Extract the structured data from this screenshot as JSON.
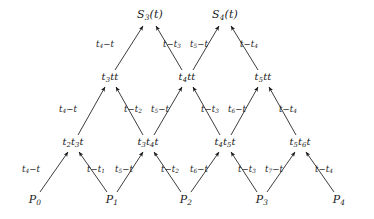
{
  "diagram": {
    "width": 374,
    "height": 219,
    "background": "#ffffff",
    "ink": "#1a1a1a",
    "levels": [
      {
        "name": "control-points",
        "row": 0,
        "y": 200,
        "nodes": [
          {
            "id": "P0",
            "label": "P0",
            "base": "P",
            "sub": "0",
            "x": 35
          },
          {
            "id": "P1",
            "label": "P1",
            "base": "P",
            "sub": "1",
            "x": 112
          },
          {
            "id": "P2",
            "label": "P2",
            "base": "P",
            "sub": "2",
            "x": 186
          },
          {
            "id": "P3",
            "label": "P3",
            "base": "P",
            "sub": "3",
            "x": 262
          },
          {
            "id": "P4",
            "label": "P4",
            "base": "P",
            "sub": "4",
            "x": 339
          }
        ]
      },
      {
        "name": "level-1",
        "row": 1,
        "y": 143,
        "nodes": [
          {
            "id": "L1A",
            "label": "t2t3t",
            "x": 73
          },
          {
            "id": "L1B",
            "label": "t3t4t",
            "x": 148
          },
          {
            "id": "L1C",
            "label": "t4t5t",
            "x": 225
          },
          {
            "id": "L1D",
            "label": "t5t6t",
            "x": 300
          }
        ]
      },
      {
        "name": "level-2",
        "row": 2,
        "y": 78,
        "nodes": [
          {
            "id": "L2A",
            "label": "t3tt",
            "x": 110
          },
          {
            "id": "L2B",
            "label": "t4tt",
            "x": 187
          },
          {
            "id": "L2C",
            "label": "t5tt",
            "x": 263
          }
        ]
      },
      {
        "name": "splines",
        "row": 3,
        "y": 15,
        "nodes": [
          {
            "id": "S3",
            "label": "S3(t)",
            "base": "S",
            "sub": "3",
            "arg": "(t)",
            "x": 150
          },
          {
            "id": "S4",
            "label": "S4(t)",
            "base": "S",
            "sub": "4",
            "arg": "(t)",
            "x": 225
          }
        ]
      }
    ],
    "edges": [
      {
        "id": "e-p0-l1a",
        "from": "P0",
        "to": "L1A",
        "x1": 40,
        "y1": 192,
        "x2": 68,
        "y2": 152,
        "label": "t4-t",
        "lx": 31,
        "ly": 170
      },
      {
        "id": "e-p1-l1a",
        "from": "P1",
        "to": "L1A",
        "x1": 107,
        "y1": 192,
        "x2": 79,
        "y2": 152,
        "label": "t-t1",
        "lx": 96,
        "ly": 170
      },
      {
        "id": "e-p1-l1b",
        "from": "P1",
        "to": "L1B",
        "x1": 117,
        "y1": 192,
        "x2": 143,
        "y2": 152,
        "label": "t5-t",
        "lx": 124,
        "ly": 170
      },
      {
        "id": "e-p2-l1b",
        "from": "P2",
        "to": "L1B",
        "x1": 181,
        "y1": 192,
        "x2": 154,
        "y2": 152,
        "label": "t-t2",
        "lx": 170,
        "ly": 170
      },
      {
        "id": "e-p2-l1c",
        "from": "P2",
        "to": "L1C",
        "x1": 191,
        "y1": 192,
        "x2": 219,
        "y2": 152,
        "label": "t6-t",
        "lx": 199,
        "ly": 170
      },
      {
        "id": "e-p3-l1c",
        "from": "P3",
        "to": "L1C",
        "x1": 257,
        "y1": 192,
        "x2": 231,
        "y2": 152,
        "label": "t-t3",
        "lx": 247,
        "ly": 170
      },
      {
        "id": "e-p3-l1d",
        "from": "P3",
        "to": "L1D",
        "x1": 267,
        "y1": 192,
        "x2": 295,
        "y2": 152,
        "label": "t7-t",
        "lx": 274,
        "ly": 170
      },
      {
        "id": "e-p4-l1d",
        "from": "P4",
        "to": "L1D",
        "x1": 334,
        "y1": 192,
        "x2": 306,
        "y2": 152,
        "label": "t-t4",
        "lx": 324,
        "ly": 170
      },
      {
        "id": "e-l1a-l2a",
        "from": "L1A",
        "to": "L2A",
        "x1": 78,
        "y1": 135,
        "x2": 105,
        "y2": 87,
        "label": "t4-t",
        "lx": 68,
        "ly": 110
      },
      {
        "id": "e-l1b-l2a",
        "from": "L1B",
        "to": "L2A",
        "x1": 143,
        "y1": 135,
        "x2": 116,
        "y2": 87,
        "label": "t-t2",
        "lx": 133,
        "ly": 110
      },
      {
        "id": "e-l1b-l2b",
        "from": "L1B",
        "to": "L2B",
        "x1": 154,
        "y1": 135,
        "x2": 182,
        "y2": 87,
        "label": "t5-t",
        "lx": 160,
        "ly": 110
      },
      {
        "id": "e-l1c-l2b",
        "from": "L1C",
        "to": "L2B",
        "x1": 220,
        "y1": 135,
        "x2": 193,
        "y2": 87,
        "label": "t-t3",
        "lx": 210,
        "ly": 110
      },
      {
        "id": "e-l1c-l2c",
        "from": "L1C",
        "to": "L2C",
        "x1": 231,
        "y1": 135,
        "x2": 258,
        "y2": 87,
        "label": "t6-t",
        "lx": 237,
        "ly": 110
      },
      {
        "id": "e-l1d-l2c",
        "from": "L1D",
        "to": "L2C",
        "x1": 296,
        "y1": 135,
        "x2": 269,
        "y2": 87,
        "label": "t-t4",
        "lx": 288,
        "ly": 110
      },
      {
        "id": "e-l2a-s3",
        "from": "L2A",
        "to": "S3",
        "x1": 115,
        "y1": 70,
        "x2": 143,
        "y2": 26,
        "label": "t4-t",
        "lx": 105,
        "ly": 45
      },
      {
        "id": "e-l2b-s3",
        "from": "L2B",
        "to": "S3",
        "x1": 182,
        "y1": 70,
        "x2": 156,
        "y2": 26,
        "label": "t-t3",
        "lx": 172,
        "ly": 45
      },
      {
        "id": "e-l2b-s4",
        "from": "L2B",
        "to": "S4",
        "x1": 193,
        "y1": 70,
        "x2": 219,
        "y2": 26,
        "label": "t5-t",
        "lx": 199,
        "ly": 45
      },
      {
        "id": "e-l2c-s4",
        "from": "L2C",
        "to": "S4",
        "x1": 258,
        "y1": 70,
        "x2": 231,
        "y2": 26,
        "label": "t-t4",
        "lx": 249,
        "ly": 45
      }
    ]
  }
}
